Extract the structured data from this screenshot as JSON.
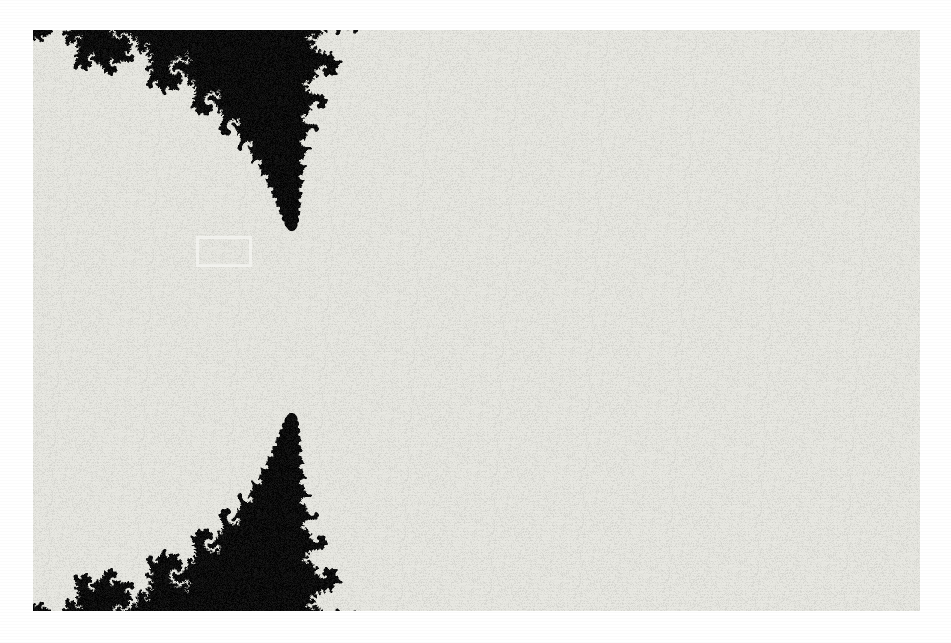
{
  "figure": {
    "kind": "mandelbrot-set-detail",
    "caption_text": "",
    "paper_color": "#ffffff",
    "ink_color": "#080808",
    "highlight_color": "#f2f2ee",
    "plate": {
      "left": 33,
      "top": 30,
      "width": 887,
      "height": 581
    },
    "roi": {
      "label": "zoom-region",
      "left": 196,
      "top": 236,
      "width": 56,
      "height": 31,
      "border_width": 3,
      "border_color": "#f2f2ee"
    }
  },
  "chart_data": {
    "type": "heatmap",
    "title": "",
    "subtitle": "",
    "xlabel": "Re(c)",
    "ylabel": "Im(c)",
    "colorscheme": "binary-inverted",
    "rendering": {
      "inside_color": "#e8e8e2",
      "outside_color": "#0b0b0b",
      "escape_radius": 4,
      "max_iterations": 180,
      "threshold_iteration": 34,
      "grain_amount": 0.16,
      "blur_px": 0.55
    },
    "axis_ranges": {
      "re_min": -1.02,
      "re_max": -0.115,
      "im_min": -0.295,
      "im_max": 0.298
    },
    "xlim": [
      -1.02,
      -0.115
    ],
    "ylim": [
      -0.295,
      0.298
    ],
    "grid": false,
    "legend": "none",
    "annotations": [
      {
        "name": "zoom-region",
        "shape": "rectangle",
        "re_min": -0.855,
        "re_max": -0.798,
        "im_min": 0.043,
        "im_max": 0.075,
        "stroke": "#f2f2ee",
        "stroke_width": 3
      }
    ],
    "features": [
      {
        "name": "main-cardioid-body",
        "re": -0.26,
        "im": 0.0
      },
      {
        "name": "period-2-bulb-neck",
        "re": -0.75,
        "im": 0.0
      },
      {
        "name": "satellite-star-primary",
        "re": -0.745,
        "im": 0.053
      },
      {
        "name": "seahorse-valley-spirals",
        "re": -0.6,
        "im": 0.12
      },
      {
        "name": "filament-chain-lower",
        "re": -0.7,
        "im": -0.11
      },
      {
        "name": "isolated-islands-bottom",
        "re": -0.37,
        "im": -0.27
      }
    ]
  }
}
